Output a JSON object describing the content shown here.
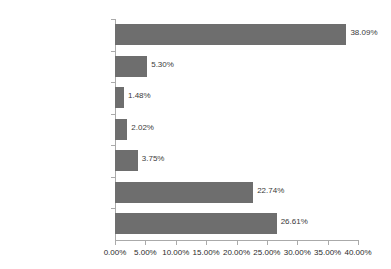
{
  "chart_data": {
    "type": "bar",
    "orientation": "horizontal",
    "title": "",
    "xlabel": "",
    "ylabel": "",
    "grid": false,
    "legend": false,
    "xlim": [
      0,
      40
    ],
    "categories": [
      "Personal Computers",
      "Mid-range Computers",
      "Mainframe Computers",
      "Storage Devices",
      "Networks",
      "Operating Software",
      "Application Software"
    ],
    "values": [
      38.09,
      5.3,
      1.48,
      2.02,
      3.75,
      22.74,
      26.61
    ],
    "data_labels": [
      "38.09%",
      "5.30%",
      "1.48%",
      "2.02%",
      "3.75%",
      "22.74%",
      "26.61%"
    ],
    "xticks": [
      0,
      5,
      10,
      15,
      20,
      25,
      30,
      35,
      40
    ],
    "xtick_labels": [
      "0.00%",
      "5.00%",
      "10.00%",
      "15.00%",
      "20.00%",
      "25.00%",
      "30.00%",
      "35.00%",
      "40.00%"
    ],
    "bar_color": "#6e6e6e",
    "axis_color": "#aaaaaa",
    "text_color": "#2b2b2b",
    "background": "#ffffff"
  }
}
